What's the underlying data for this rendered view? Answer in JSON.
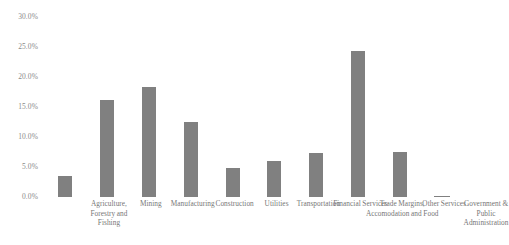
{
  "chart_data": {
    "type": "bar",
    "title": "",
    "subtitle": "",
    "xlabel": "",
    "ylabel": "",
    "categories": [
      "Agriculture, Forestry and Fishing",
      "Mining",
      "Manufacturing",
      "Construction",
      "Utilities",
      "Transportation",
      "Financial Services",
      "Trade Margins, Accomodation and Food",
      "Other Services",
      "Government & Public Administration"
    ],
    "values": [
      3.5,
      16.1,
      18.4,
      12.5,
      4.8,
      6.0,
      7.3,
      24.4,
      7.5,
      0.2
    ],
    "value_labels": [
      "3.5%",
      "16.1%",
      "18.4%",
      "12.5%",
      "4.8%",
      "6.0%",
      "7.3%",
      "24.4%",
      "7.5%",
      "0.2%"
    ],
    "ylim": [
      0,
      30
    ],
    "ytick_values": [
      30,
      25,
      20,
      15,
      10,
      5,
      0
    ],
    "ytick_labels": [
      "30.0%",
      "25.0%",
      "20.0%",
      "15.0%",
      "10.0%",
      "5.0%",
      "0.0%"
    ],
    "grid": false,
    "legend": false,
    "legend_position": "none",
    "series": [
      {
        "name": "Share",
        "color": "#808080",
        "values": [
          3.5,
          16.1,
          18.4,
          12.5,
          4.8,
          6.0,
          7.3,
          24.4,
          7.5,
          0.2
        ]
      }
    ],
    "colors": {
      "bar": "#808080",
      "background": "#ffffff",
      "tick_text": "#8a8a8a",
      "label_text": "#767676"
    }
  }
}
